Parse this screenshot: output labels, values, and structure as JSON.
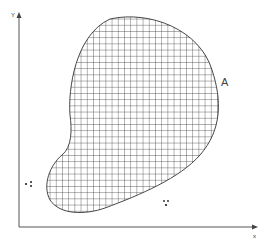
{
  "diagram": {
    "axes": {
      "x_label": "x",
      "y_label": "Y"
    },
    "region": {
      "label": "A",
      "fill": "crosshatch grid",
      "stroke_color": "#333333"
    },
    "markers": [
      {
        "text": "∙⁑",
        "position": "left, outside region"
      },
      {
        "text": "⁑",
        "position": "lower right, outside region"
      }
    ]
  }
}
